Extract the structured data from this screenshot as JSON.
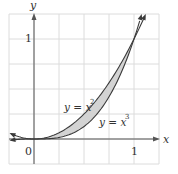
{
  "chart_data": {
    "type": "line",
    "title": "",
    "xlabel": "x",
    "ylabel": "y",
    "xlim": [
      -0.25,
      1.25
    ],
    "ylim": [
      -0.25,
      1.25
    ],
    "grid": true,
    "grid_step": 0.25,
    "x_ticks": [
      {
        "value": 0,
        "label": "0"
      },
      {
        "value": 1,
        "label": "1"
      }
    ],
    "y_ticks": [
      {
        "value": 1,
        "label": "1"
      }
    ],
    "series": [
      {
        "name": "y = x^2",
        "label_main": "y = x",
        "label_exp": "2",
        "function": "x^2",
        "x": [
          -0.23,
          0,
          0.25,
          0.5,
          0.75,
          1,
          1.118
        ],
        "values": [
          0.053,
          0,
          0.0625,
          0.25,
          0.5625,
          1,
          1.25
        ]
      },
      {
        "name": "y = x^3",
        "label_main": "y = x",
        "label_exp": "3",
        "function": "x^3",
        "x": [
          -0.23,
          0,
          0.25,
          0.5,
          0.75,
          1,
          1.077
        ],
        "values": [
          -0.012,
          0,
          0.0156,
          0.125,
          0.4219,
          1,
          1.25
        ]
      }
    ],
    "shaded_region": {
      "between": [
        "x^2",
        "x^3"
      ],
      "x_range": [
        0,
        1
      ],
      "color": "#d3d3d3"
    },
    "annotations": [
      {
        "text": "y = x^2",
        "x": 0.45,
        "y": 0.38
      },
      {
        "text": "y = x^3",
        "x": 0.7,
        "y": 0.15
      }
    ]
  },
  "colors": {
    "grid": "#dcdcdc",
    "axis": "#555555",
    "curve": "#3a3a3a",
    "fill": "#d3d3d3"
  }
}
